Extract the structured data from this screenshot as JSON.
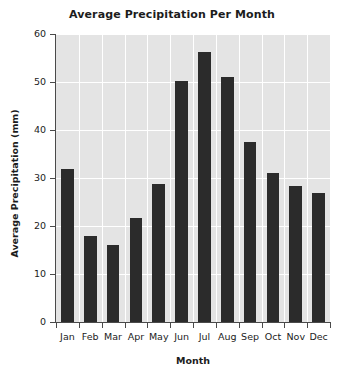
{
  "chart_data": {
    "type": "bar",
    "title": "Average Precipitation Per Month",
    "xlabel": "Month",
    "ylabel": "Average Precipitation (mm)",
    "categories": [
      "Jan",
      "Feb",
      "Mar",
      "Apr",
      "May",
      "Jun",
      "Jul",
      "Aug",
      "Sep",
      "Oct",
      "Nov",
      "Dec"
    ],
    "values": [
      31.8,
      18.0,
      16.0,
      21.7,
      28.8,
      50.2,
      56.3,
      51.0,
      37.4,
      31.0,
      28.3,
      26.8
    ],
    "ylim": [
      0,
      60
    ],
    "yticks": [
      0,
      10,
      20,
      30,
      40,
      50,
      60
    ],
    "ytick_labels": [
      "0",
      "10",
      "20",
      "30",
      "40",
      "50",
      "60"
    ],
    "grid": true,
    "legend": "none",
    "colors": {
      "bar": "#2b2b2b",
      "plot_background": "#e4e4e4",
      "gridline": "#ffffff",
      "axis": "#4a4a4a",
      "text": "#1c1c1c",
      "page_background": "#ffffff"
    }
  }
}
